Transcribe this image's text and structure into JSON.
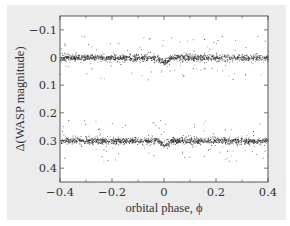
{
  "chart_data": {
    "type": "scatter",
    "title": "",
    "xlabel": "orbital phase, ϕ",
    "ylabel": "Δ(WASP magnitude)",
    "xlim": [
      -0.4,
      0.4
    ],
    "ylim": [
      0.45,
      -0.15
    ],
    "y_inverted": true,
    "grid": false,
    "legend": null,
    "x_ticks": [
      -0.4,
      -0.2,
      0,
      0.2,
      0.4
    ],
    "x_tick_labels": [
      "−0.4",
      "−0.2",
      "0",
      "0.2",
      "0.4"
    ],
    "y_ticks": [
      -0.1,
      0,
      0.1,
      0.2,
      0.3,
      0.4
    ],
    "y_tick_labels": [
      "−0.1",
      "0",
      "0.1",
      "0.2",
      "0.3",
      "0.4"
    ],
    "series": [
      {
        "name": "light curve 1",
        "baseline": 0.0,
        "scatter_sigma": 0.006,
        "transit_center_phase": 0.0,
        "transit_depth": 0.015,
        "transit_half_width": 0.025,
        "outlier_fraction": 0.08,
        "n_points": 1400,
        "color": "#222222"
      },
      {
        "name": "light curve 2 (offset +0.3)",
        "baseline": 0.3,
        "scatter_sigma": 0.006,
        "transit_center_phase": 0.0,
        "transit_depth": 0.012,
        "transit_half_width": 0.025,
        "outlier_fraction": 0.06,
        "n_points": 1400,
        "color": "#222222"
      }
    ]
  },
  "colors": {
    "panel_background": "#ececec",
    "plot_background": "#ffffff",
    "axis": "#555555",
    "points": "#222222",
    "text": "#333333"
  }
}
